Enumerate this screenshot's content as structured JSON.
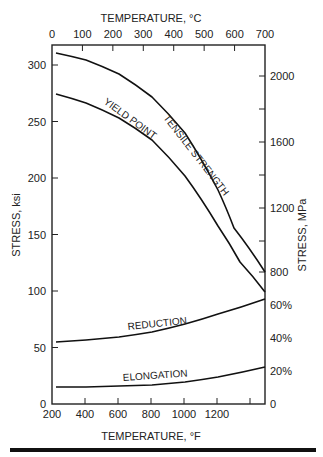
{
  "chart_data": {
    "type": "line",
    "title": "",
    "top_axis": {
      "label": "TEMPERATURE, °C",
      "ticks": [
        "0",
        "100",
        "200",
        "300",
        "400",
        "500",
        "600",
        "700"
      ]
    },
    "bottom_axis": {
      "label": "TEMPERATURE, °F",
      "ticks": [
        "200",
        "400",
        "600",
        "800",
        "1000",
        "1200"
      ]
    },
    "left_axis": {
      "label": "STRESS, ksi",
      "ticks": [
        "0",
        "50",
        "100",
        "150",
        "200",
        "250",
        "300"
      ],
      "ylim": [
        0,
        320
      ]
    },
    "right_axis_stress": {
      "label": "STRESS, MPa",
      "ticks": [
        "800",
        "1200",
        "1600",
        "2000"
      ]
    },
    "right_axis_percent": {
      "ticks": [
        "0",
        "20%",
        "40%",
        "60%"
      ]
    },
    "xlabel": "TEMPERATURE, °F",
    "ylabel": "STRESS, ksi",
    "x": [
      212,
      400,
      600,
      800,
      1000,
      1200,
      1292
    ],
    "series": [
      {
        "name": "TENSILE STRENGTH",
        "unit": "ksi",
        "values": [
          310,
          298,
          275,
          240,
          190,
          140,
          117
        ]
      },
      {
        "name": "YIELD POINT",
        "unit": "ksi",
        "values": [
          273,
          262,
          242,
          210,
          165,
          120,
          99
        ]
      },
      {
        "name": "REDUCTION",
        "unit": "%",
        "values": [
          37,
          38,
          40,
          43,
          48,
          55,
          62
        ]
      },
      {
        "name": "ELONGATION",
        "unit": "%",
        "values": [
          10,
          10,
          10.5,
          11,
          13,
          17,
          22
        ]
      }
    ],
    "grid": false,
    "legend": "inline labels on curves"
  }
}
